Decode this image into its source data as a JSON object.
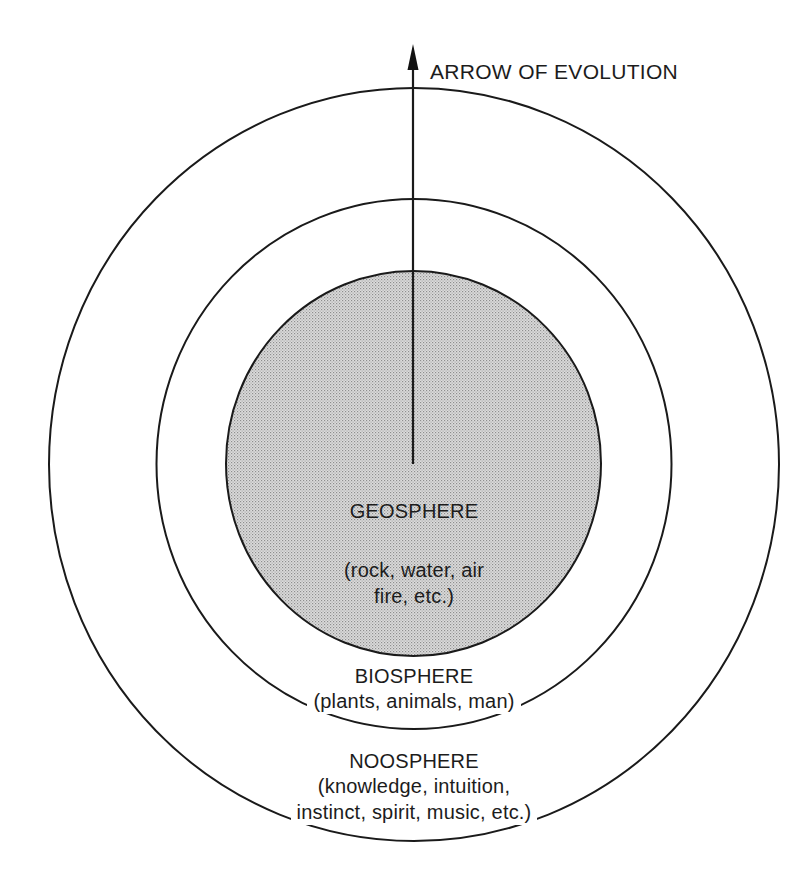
{
  "diagram": {
    "colors": {
      "stroke": "#1a1a1a",
      "background": "#ffffff",
      "geosphere_fill": "#d2d2d2",
      "geosphere_dots": "#9a9a9a"
    },
    "arrow": {
      "label": "ARROW OF EVOLUTION"
    },
    "spheres": [
      {
        "id": "geosphere",
        "name": "GEOSPHERE",
        "description_line1": "(rock, water, air",
        "description_line2": "fire, etc.)"
      },
      {
        "id": "biosphere",
        "name": "BIOSPHERE",
        "description": "(plants, animals, man)"
      },
      {
        "id": "noosphere",
        "name": "NOOSPHERE",
        "description_line1": "(knowledge, intuition,",
        "description_line2": "instinct, spirit, music, etc.)"
      }
    ]
  }
}
